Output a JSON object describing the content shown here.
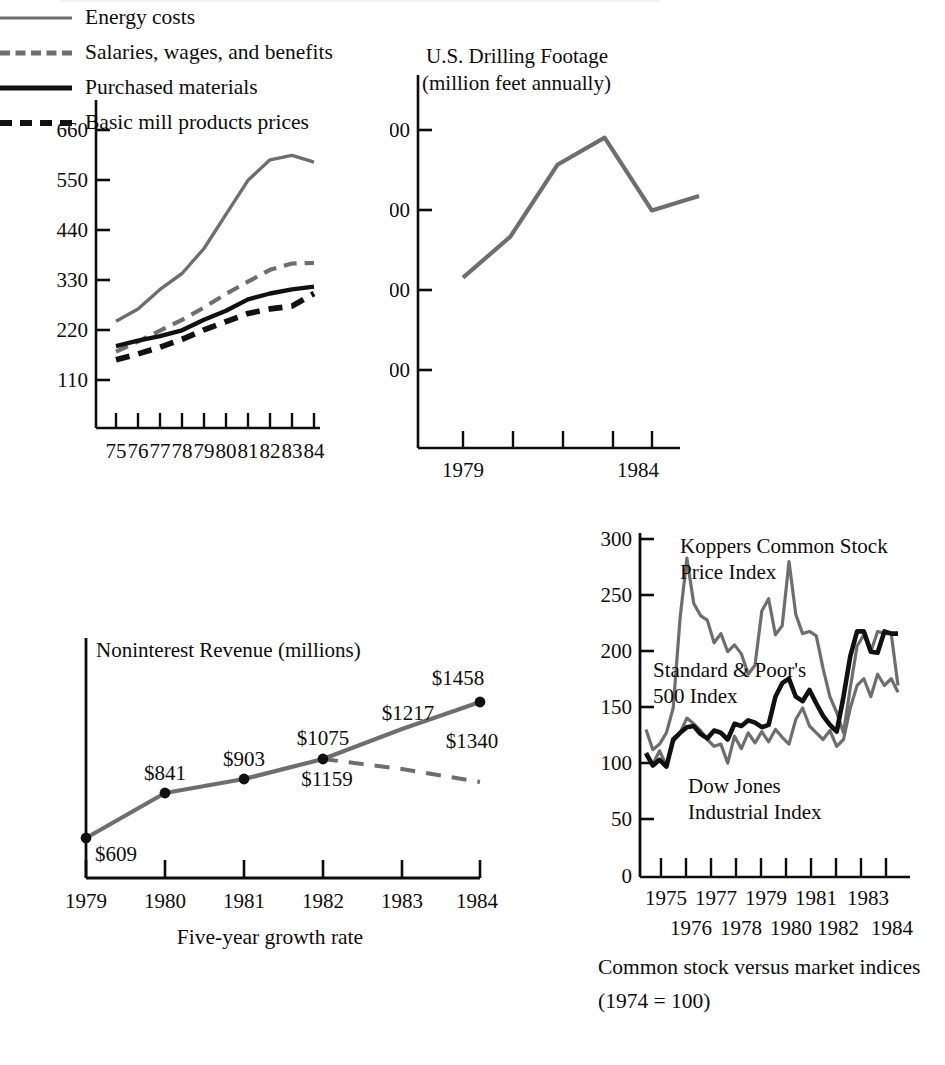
{
  "page": {
    "background": "#ffffff",
    "ink": "#0d0d0d",
    "gray_line": "#6e6e6e",
    "black_line": "#111111"
  },
  "legend": {
    "items": [
      {
        "label": "Energy costs",
        "style": "solid",
        "color": "#6e6e6e",
        "swatch": "sw-solid-gray"
      },
      {
        "label": "Salaries, wages, and benefits",
        "style": "dashed",
        "color": "#6e6e6e",
        "swatch": "sw-dash-gray"
      },
      {
        "label": "Purchased materials",
        "style": "solid",
        "color": "#111111",
        "swatch": "sw-solid-black"
      },
      {
        "label": "Basic mill products prices",
        "style": "dashed",
        "color": "#111111",
        "swatch": "sw-dash-black"
      }
    ]
  },
  "revenue_caption": "Five-year growth rate",
  "stock_caption_line1": "Common stock versus market indices",
  "stock_caption_line2": "(1974  =  100)",
  "chart_data": [
    {
      "id": "cost-indices",
      "type": "line",
      "title": "",
      "xlabel": "",
      "ylabel": "",
      "categories": [
        "75",
        "76",
        "77",
        "78",
        "79",
        "80",
        "81",
        "82",
        "83",
        "84"
      ],
      "ytick_labels": [
        "110",
        "220",
        "330",
        "440",
        "550",
        "660"
      ],
      "yticks": [
        110,
        220,
        330,
        440,
        550,
        660
      ],
      "ylim": [
        0,
        700
      ],
      "grid": false,
      "legend_position": "below",
      "series": [
        {
          "name": "Energy costs",
          "color": "#6e6e6e",
          "style": "solid",
          "values": [
            235,
            262,
            305,
            340,
            395,
            470,
            545,
            590,
            600,
            585
          ]
        },
        {
          "name": "Salaries, wages, and benefits",
          "color": "#6e6e6e",
          "style": "dashed",
          "values": [
            168,
            190,
            214,
            238,
            265,
            295,
            322,
            348,
            362,
            363
          ]
        },
        {
          "name": "Purchased materials",
          "color": "#111111",
          "style": "solid",
          "values": [
            180,
            192,
            202,
            215,
            238,
            258,
            283,
            296,
            305,
            311
          ]
        },
        {
          "name": "Basic mill products prices",
          "color": "#111111",
          "style": "dashed",
          "values": [
            150,
            163,
            178,
            195,
            216,
            234,
            252,
            262,
            268,
            296
          ]
        }
      ]
    },
    {
      "id": "drilling-footage",
      "type": "line",
      "title": "U.S. Drilling Footage",
      "subtitle": "(million feet annually)",
      "xlabel": "",
      "ylabel": "",
      "x": [
        "1979",
        "1980",
        "1981",
        "1982",
        "1983",
        "1984"
      ],
      "xtick_labels_shown": [
        "1979",
        "1984"
      ],
      "ytick_labels": [
        "100",
        "200",
        "300",
        "400"
      ],
      "yticks": [
        100,
        200,
        300,
        400
      ],
      "ylim": [
        0,
        450
      ],
      "grid": false,
      "series": [
        {
          "name": "U.S. Drilling Footage",
          "color": "#6e6e6e",
          "style": "solid",
          "values": [
            213,
            264,
            354,
            388,
            297,
            315
          ]
        }
      ]
    },
    {
      "id": "noninterest-revenue",
      "type": "line",
      "title": "Noninterest Revenue (millions)",
      "xlabel": "Five-year growth rate",
      "ylabel": "",
      "categories": [
        "1979",
        "1980",
        "1981",
        "1982",
        "1983",
        "1984"
      ],
      "ylim": [
        0,
        1600
      ],
      "grid": false,
      "series": [
        {
          "name": "Actual",
          "color": "#6e6e6e",
          "style": "solid",
          "markers": true,
          "values": [
            609,
            841,
            903,
            1075,
            1217,
            1458
          ],
          "point_labels": [
            "$609",
            "$841",
            "$903",
            "$1075",
            "$1217",
            "$1458"
          ]
        },
        {
          "name": "Alternate",
          "color": "#6e6e6e",
          "style": "dashed",
          "markers": false,
          "values": [
            null,
            null,
            null,
            1075,
            1159,
            1340
          ],
          "point_labels": [
            "",
            "",
            "",
            "",
            "$1159",
            "$1340"
          ]
        }
      ]
    },
    {
      "id": "stock-indices",
      "type": "line",
      "title": "",
      "subtitle": "Common stock versus market indices (1974 = 100)",
      "xlabel": "",
      "ylabel": "",
      "ytick_labels": [
        "0",
        "50",
        "100",
        "150",
        "200",
        "250",
        "300"
      ],
      "yticks": [
        0,
        50,
        100,
        150,
        200,
        250,
        300
      ],
      "ylim": [
        0,
        300
      ],
      "xtick_labels_top": [
        "1975",
        "1977",
        "1979",
        "1981",
        "1983"
      ],
      "xtick_labels_bottom": [
        "1976",
        "1978",
        "1980",
        "1982",
        "1984"
      ],
      "grid": false,
      "annotations": [
        {
          "text_line1": "Koppers Common Stock",
          "text_line2": "Price Index"
        },
        {
          "text_line1": "Standard & Poor's",
          "text_line2": "500 Index"
        },
        {
          "text_line1": "Dow Jones",
          "text_line2": "Industrial Index"
        }
      ],
      "series": [
        {
          "name": "Koppers Common Stock Price Index",
          "color": "#6e6e6e",
          "style": "solid",
          "values": [
            131,
            113,
            118,
            128,
            150,
            230,
            283,
            243,
            232,
            228,
            208,
            216,
            200,
            206,
            198,
            180,
            188,
            236,
            247,
            215,
            223,
            280,
            233,
            216,
            218,
            214,
            185,
            160,
            146,
            128,
            168,
            205,
            215,
            200,
            218,
            216,
            216,
            170
          ]
        },
        {
          "name": "Standard & Poor's 500 Index",
          "color": "#111111",
          "style": "solid",
          "values": [
            110,
            99,
            104,
            98,
            122,
            128,
            133,
            134,
            127,
            123,
            130,
            128,
            122,
            136,
            134,
            139,
            137,
            133,
            135,
            160,
            172,
            176,
            160,
            156,
            166,
            154,
            143,
            135,
            129,
            160,
            196,
            218,
            218,
            200,
            199,
            218,
            216,
            216
          ]
        },
        {
          "name": "Dow Jones Industrial Index",
          "color": "#6e6e6e",
          "style": "solid",
          "values": [
            108,
            100,
            112,
            99,
            120,
            128,
            141,
            136,
            130,
            122,
            116,
            118,
            101,
            125,
            114,
            128,
            119,
            129,
            120,
            131,
            124,
            118,
            140,
            150,
            134,
            128,
            122,
            130,
            116,
            122,
            150,
            170,
            176,
            160,
            180,
            170,
            176,
            164
          ]
        }
      ]
    }
  ]
}
